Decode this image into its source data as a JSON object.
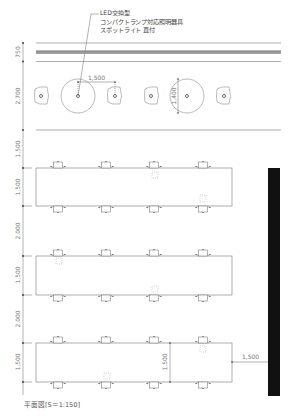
{
  "drawing": {
    "type": "floor-plan",
    "caption": "平面図[S＝1:150]",
    "annotation": {
      "line1": "LED交換型",
      "line2": "コンパクトランプ対応照明器具",
      "line3": "スポットライト 直付"
    },
    "vertical_dimensions": [
      "750",
      "2,700",
      "1,500",
      "1,500",
      "2,000",
      "1,500",
      "2,000",
      "1,500"
    ],
    "inner_dimensions": {
      "fixture_spacing": "1,500",
      "fixture_diameter": "1,400",
      "table_depth": "1,500",
      "aisle_width": "1,500"
    },
    "colors": {
      "line": "#555555",
      "dim_text": "#777777",
      "wall": "#111111"
    },
    "lighting_fixtures": [
      {
        "kind": "spot",
        "x": 40
      },
      {
        "kind": "round",
        "x": 78
      },
      {
        "kind": "spot",
        "x": 115
      },
      {
        "kind": "spot",
        "x": 151
      },
      {
        "kind": "round",
        "x": 187
      },
      {
        "kind": "spot",
        "x": 224
      }
    ],
    "tables": [
      {
        "id": 1,
        "top": 168,
        "bottom": 206
      },
      {
        "id": 2,
        "top": 256,
        "bottom": 295
      },
      {
        "id": 3,
        "top": 343,
        "bottom": 382
      }
    ],
    "chair_columns_x": [
      58,
      106,
      154,
      203
    ]
  }
}
